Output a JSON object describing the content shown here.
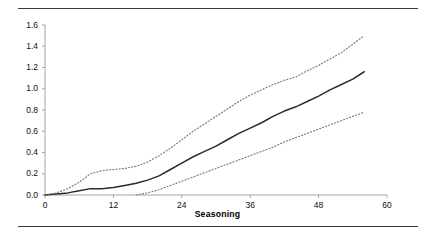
{
  "chart_data": {
    "type": "line",
    "title": "",
    "xlabel": "Seasoning",
    "ylabel": "",
    "xlim": [
      0,
      60
    ],
    "ylim": [
      0,
      1.6
    ],
    "grid": false,
    "legend": "none",
    "xticks": [
      0,
      12,
      24,
      36,
      48,
      60
    ],
    "xtick_labels": [
      "0",
      "12",
      "24",
      "36",
      "48",
      "60"
    ],
    "yticks": [
      0.0,
      0.2,
      0.4,
      0.6,
      0.8,
      1.0,
      1.2,
      1.4,
      1.6
    ],
    "ytick_labels": [
      "0.0",
      "0.2",
      "0.4",
      "0.6",
      "0.8",
      "1.0",
      "1.2",
      "1.4",
      "1.6"
    ],
    "x": [
      0,
      2,
      4,
      6,
      8,
      10,
      12,
      14,
      16,
      18,
      20,
      22,
      24,
      26,
      28,
      30,
      32,
      34,
      36,
      38,
      40,
      42,
      44,
      46,
      48,
      50,
      52,
      54,
      56
    ],
    "series": [
      {
        "name": "estimate",
        "style": "solid",
        "color": "#2b2b2b",
        "values": [
          0.0,
          0.01,
          0.02,
          0.04,
          0.06,
          0.06,
          0.07,
          0.09,
          0.11,
          0.14,
          0.18,
          0.24,
          0.3,
          0.36,
          0.41,
          0.46,
          0.52,
          0.58,
          0.63,
          0.68,
          0.74,
          0.79,
          0.83,
          0.88,
          0.93,
          0.99,
          1.04,
          1.09,
          1.16
        ]
      },
      {
        "name": "upper-confidence-band",
        "style": "dotted",
        "color": "#7a7a7a",
        "values": [
          0.0,
          0.02,
          0.06,
          0.12,
          0.2,
          0.23,
          0.24,
          0.25,
          0.27,
          0.31,
          0.37,
          0.44,
          0.52,
          0.6,
          0.67,
          0.74,
          0.81,
          0.88,
          0.94,
          0.99,
          1.04,
          1.08,
          1.11,
          1.17,
          1.22,
          1.28,
          1.34,
          1.42,
          1.5
        ]
      },
      {
        "name": "lower-confidence-band",
        "style": "dotted",
        "color": "#7a7a7a",
        "values": [
          null,
          null,
          null,
          null,
          null,
          null,
          null,
          null,
          0.0,
          0.02,
          0.05,
          0.09,
          0.13,
          0.17,
          0.21,
          0.25,
          0.29,
          0.33,
          0.37,
          0.41,
          0.45,
          0.5,
          0.54,
          0.58,
          0.62,
          0.66,
          0.7,
          0.74,
          0.78
        ]
      }
    ]
  },
  "figure": {
    "rule_color": "#3a3a3a",
    "axis_color": "#9a9a9a"
  }
}
